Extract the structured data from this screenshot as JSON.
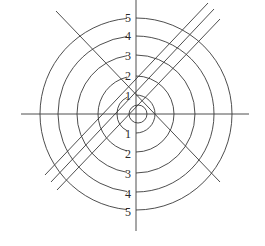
{
  "diagram": {
    "type": "concentric-circles-with-lines",
    "center": [
      136,
      114
    ],
    "stroke_color": "#3a3a3a",
    "background": "#ffffff",
    "axes": {
      "horizontal": {
        "x1": 21,
        "y1": 114,
        "x2": 249,
        "y2": 114
      },
      "vertical": {
        "x1": 136,
        "y1": 0,
        "x2": 136,
        "y2": 231
      }
    },
    "circles": [
      {
        "label": "5",
        "r": 96
      },
      {
        "label": "4",
        "r": 78
      },
      {
        "label": "3",
        "r": 59
      },
      {
        "label": "2",
        "r": 38
      },
      {
        "label": "1",
        "r": 19
      }
    ],
    "inner_circle": {
      "cx": 138,
      "cy": 114,
      "r": 9
    },
    "labels_top": [
      {
        "text": "5",
        "x": 128,
        "y": 22
      },
      {
        "text": "4",
        "x": 128,
        "y": 40
      },
      {
        "text": "3",
        "x": 128,
        "y": 60
      },
      {
        "text": "2",
        "x": 128,
        "y": 80
      },
      {
        "text": "1",
        "x": 128,
        "y": 100
      }
    ],
    "labels_bottom": [
      {
        "text": "1",
        "x": 128,
        "y": 138
      },
      {
        "text": "2",
        "x": 128,
        "y": 158
      },
      {
        "text": "3",
        "x": 128,
        "y": 178
      },
      {
        "text": "4",
        "x": 128,
        "y": 198
      },
      {
        "text": "5",
        "x": 128,
        "y": 216
      }
    ],
    "anti_diagonal": {
      "x1": 56,
      "y1": 11,
      "x2": 220,
      "y2": 182
    },
    "parallel_lines": [
      {
        "x1": 45,
        "y1": 175,
        "x2": 208,
        "y2": 3
      },
      {
        "x1": 51,
        "y1": 182,
        "x2": 214,
        "y2": 9
      },
      {
        "x1": 57,
        "y1": 190,
        "x2": 220,
        "y2": 19
      }
    ]
  }
}
